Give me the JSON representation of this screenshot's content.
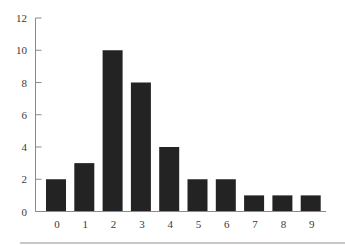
{
  "chart_data": {
    "type": "bar",
    "title": "",
    "xlabel": "",
    "ylabel": "",
    "categories": [
      "0",
      "1",
      "2",
      "3",
      "4",
      "5",
      "6",
      "7",
      "8",
      "9"
    ],
    "values": [
      2,
      3,
      10,
      8,
      4,
      2,
      2,
      1,
      1,
      1
    ],
    "ylim": [
      0,
      12
    ],
    "yticks": [
      "0",
      "2",
      "4",
      "6",
      "8",
      "10",
      "12"
    ],
    "grid": false,
    "legend": null,
    "colors": {
      "bar": "#232323",
      "axis": "#8a8a8a",
      "text": "#3a3a3a"
    }
  }
}
